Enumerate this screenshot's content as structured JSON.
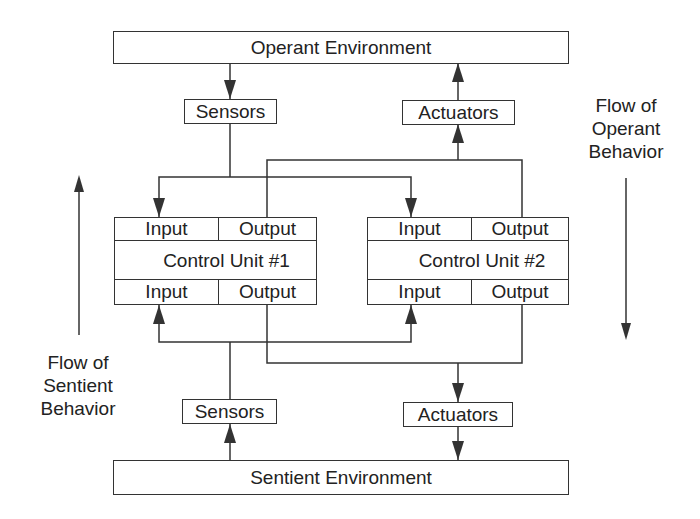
{
  "environments": {
    "operant": "Operant Environment",
    "sentient": "Sentient Environment"
  },
  "top": {
    "sensors": "Sensors",
    "actuators": "Actuators"
  },
  "bottom": {
    "sensors": "Sensors",
    "actuators": "Actuators"
  },
  "control_units": [
    {
      "name": "Control Unit #1",
      "top_input": "Input",
      "top_output": "Output",
      "bottom_input": "Input",
      "bottom_output": "Output"
    },
    {
      "name": "Control Unit #2",
      "top_input": "Input",
      "top_output": "Output",
      "bottom_input": "Input",
      "bottom_output": "Output"
    }
  ],
  "flows": {
    "operant": [
      "Flow of",
      "Operant",
      "Behavior"
    ],
    "sentient": [
      "Flow of",
      "Sentient",
      "Behavior"
    ]
  },
  "colors": {
    "line": "#333333",
    "background": "#ffffff"
  }
}
